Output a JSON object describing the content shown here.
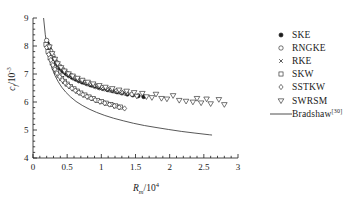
{
  "chart_data": {
    "type": "scatter",
    "title": "",
    "xlabel": "R_m/10^4",
    "ylabel": "c_f/10^-3",
    "xlabel_base": "R",
    "xlabel_sub": "m",
    "xlabel_div": "/10",
    "xlabel_exp": "4",
    "ylabel_base": "c",
    "ylabel_sub": "f",
    "ylabel_div": "/10",
    "ylabel_exp": "-3",
    "xlim": [
      0,
      3
    ],
    "ylim": [
      4,
      9
    ],
    "xticks": [
      0,
      0.5,
      1,
      1.5,
      2,
      2.5,
      3
    ],
    "xticklabels": [
      "0",
      "0.5",
      "1",
      "1.5",
      "2",
      "2.5",
      "3"
    ],
    "yticks": [
      4,
      5,
      6,
      7,
      8,
      9
    ],
    "yticklabels": [
      "4",
      "5",
      "6",
      "7",
      "8",
      "9"
    ],
    "x_minor_per_major": 5,
    "y_minor_per_major": 5,
    "grid": false,
    "legend_position": "upper-right-outside",
    "series": [
      {
        "name": "SKE",
        "marker": "filled-circle",
        "color": "#1a1a1a",
        "points": [
          [
            0.21,
            8.1
          ],
          [
            0.24,
            7.92
          ],
          [
            0.27,
            7.74
          ],
          [
            0.3,
            7.58
          ],
          [
            0.33,
            7.44
          ],
          [
            0.36,
            7.32
          ],
          [
            0.4,
            7.2
          ],
          [
            0.44,
            7.1
          ],
          [
            0.48,
            7.02
          ],
          [
            0.52,
            6.95
          ],
          [
            0.57,
            6.88
          ],
          [
            0.62,
            6.82
          ],
          [
            0.67,
            6.76
          ],
          [
            0.72,
            6.71
          ],
          [
            0.78,
            6.66
          ],
          [
            0.84,
            6.61
          ],
          [
            0.9,
            6.56
          ],
          [
            0.96,
            6.52
          ],
          [
            1.02,
            6.48
          ],
          [
            1.09,
            6.44
          ],
          [
            1.16,
            6.4
          ],
          [
            1.23,
            6.36
          ],
          [
            1.3,
            6.32
          ],
          [
            1.38,
            6.28
          ],
          [
            1.46,
            6.25
          ],
          [
            1.54,
            6.22
          ],
          [
            1.62,
            6.19
          ]
        ]
      },
      {
        "name": "RNGKE",
        "marker": "open-circle",
        "color": "#1a1a1a",
        "points": [
          [
            0.2,
            8.2
          ],
          [
            0.23,
            8.0
          ],
          [
            0.26,
            7.82
          ],
          [
            0.29,
            7.66
          ],
          [
            0.32,
            7.52
          ],
          [
            0.35,
            7.4
          ],
          [
            0.39,
            7.28
          ],
          [
            0.43,
            7.18
          ],
          [
            0.47,
            7.09
          ],
          [
            0.51,
            7.01
          ],
          [
            0.56,
            6.94
          ],
          [
            0.61,
            6.87
          ],
          [
            0.66,
            6.81
          ],
          [
            0.71,
            6.76
          ],
          [
            0.77,
            6.7
          ],
          [
            0.83,
            6.65
          ],
          [
            0.89,
            6.6
          ],
          [
            0.95,
            6.56
          ],
          [
            1.01,
            6.51
          ],
          [
            1.08,
            6.47
          ],
          [
            1.15,
            6.43
          ],
          [
            1.22,
            6.39
          ],
          [
            1.29,
            6.35
          ],
          [
            1.37,
            6.32
          ],
          [
            1.45,
            6.28
          ]
        ]
      },
      {
        "name": "RKE",
        "marker": "cross-dot",
        "color": "#1a1a1a",
        "points": [
          [
            0.22,
            7.88
          ],
          [
            0.25,
            7.72
          ],
          [
            0.28,
            7.58
          ],
          [
            0.31,
            7.46
          ],
          [
            0.34,
            7.35
          ],
          [
            0.38,
            7.24
          ],
          [
            0.42,
            7.14
          ],
          [
            0.46,
            7.06
          ],
          [
            0.5,
            6.98
          ],
          [
            0.55,
            6.91
          ],
          [
            0.6,
            6.84
          ],
          [
            0.65,
            6.78
          ],
          [
            0.7,
            6.73
          ],
          [
            0.76,
            6.67
          ],
          [
            0.82,
            6.62
          ],
          [
            0.88,
            6.57
          ],
          [
            0.94,
            6.53
          ],
          [
            1.0,
            6.48
          ],
          [
            1.07,
            6.44
          ],
          [
            1.14,
            6.4
          ],
          [
            1.21,
            6.36
          ],
          [
            1.28,
            6.33
          ],
          [
            1.36,
            6.29
          ]
        ]
      },
      {
        "name": "SKW",
        "marker": "open-square",
        "color": "#1a1a1a",
        "points": [
          [
            0.19,
            8.06
          ],
          [
            0.22,
            7.8
          ],
          [
            0.25,
            7.58
          ],
          [
            0.28,
            7.4
          ],
          [
            0.31,
            7.24
          ],
          [
            0.34,
            7.1
          ],
          [
            0.38,
            6.96
          ],
          [
            0.42,
            6.84
          ],
          [
            0.46,
            6.74
          ],
          [
            0.5,
            6.64
          ],
          [
            0.55,
            6.55
          ],
          [
            0.6,
            6.47
          ],
          [
            0.65,
            6.39
          ],
          [
            0.7,
            6.32
          ],
          [
            0.76,
            6.25
          ],
          [
            0.82,
            6.18
          ],
          [
            0.88,
            6.12
          ],
          [
            0.94,
            6.06
          ],
          [
            1.0,
            6.01
          ],
          [
            1.07,
            5.96
          ],
          [
            1.14,
            5.91
          ],
          [
            1.21,
            5.86
          ],
          [
            1.28,
            5.82
          ]
        ]
      },
      {
        "name": "SSTKW",
        "marker": "open-diamond",
        "color": "#1a1a1a",
        "points": [
          [
            0.2,
            7.95
          ],
          [
            0.23,
            7.7
          ],
          [
            0.26,
            7.5
          ],
          [
            0.29,
            7.32
          ],
          [
            0.32,
            7.17
          ],
          [
            0.35,
            7.03
          ],
          [
            0.39,
            6.9
          ],
          [
            0.43,
            6.78
          ],
          [
            0.47,
            6.68
          ],
          [
            0.52,
            6.58
          ],
          [
            0.57,
            6.49
          ],
          [
            0.62,
            6.41
          ],
          [
            0.67,
            6.34
          ],
          [
            0.73,
            6.26
          ],
          [
            0.79,
            6.19
          ],
          [
            0.85,
            6.13
          ],
          [
            0.91,
            6.07
          ],
          [
            0.98,
            6.01
          ],
          [
            1.05,
            5.96
          ],
          [
            1.12,
            5.91
          ],
          [
            1.19,
            5.86
          ],
          [
            1.26,
            5.81
          ],
          [
            1.34,
            5.77
          ]
        ]
      },
      {
        "name": "SWRSM",
        "marker": "open-down-triangle",
        "color": "#1a1a1a",
        "points": [
          [
            0.24,
            7.96
          ],
          [
            0.28,
            7.72
          ],
          [
            0.32,
            7.52
          ],
          [
            0.36,
            7.36
          ],
          [
            0.41,
            7.22
          ],
          [
            0.46,
            7.1
          ],
          [
            0.52,
            7.0
          ],
          [
            0.58,
            6.92
          ],
          [
            0.65,
            6.84
          ],
          [
            0.72,
            6.77
          ],
          [
            0.8,
            6.7
          ],
          [
            0.88,
            6.64
          ],
          [
            0.97,
            6.58
          ],
          [
            1.06,
            6.52
          ],
          [
            1.16,
            6.47
          ],
          [
            1.26,
            6.42
          ],
          [
            1.37,
            6.38
          ],
          [
            1.48,
            6.33
          ],
          [
            1.52,
            6.2
          ],
          [
            1.6,
            6.3
          ],
          [
            1.66,
            6.18
          ],
          [
            1.74,
            6.15
          ],
          [
            1.8,
            6.27
          ],
          [
            1.88,
            6.12
          ],
          [
            1.96,
            6.1
          ],
          [
            2.05,
            6.22
          ],
          [
            2.14,
            6.05
          ],
          [
            2.24,
            6.02
          ],
          [
            2.34,
            5.99
          ],
          [
            2.4,
            6.12
          ],
          [
            2.46,
            5.96
          ],
          [
            2.54,
            6.1
          ],
          [
            2.6,
            5.93
          ],
          [
            2.72,
            6.08
          ],
          [
            2.8,
            5.9
          ]
        ]
      }
    ],
    "curves": [
      {
        "name": "Bradshaw",
        "label": "Bradshaw",
        "ref": "[30]",
        "style": "solid",
        "color": "#3a3a3a",
        "points": [
          [
            0.155,
            9.0
          ],
          [
            0.18,
            8.4
          ],
          [
            0.21,
            7.9
          ],
          [
            0.24,
            7.52
          ],
          [
            0.28,
            7.2
          ],
          [
            0.32,
            6.95
          ],
          [
            0.37,
            6.72
          ],
          [
            0.42,
            6.53
          ],
          [
            0.48,
            6.35
          ],
          [
            0.55,
            6.18
          ],
          [
            0.63,
            6.02
          ],
          [
            0.72,
            5.88
          ],
          [
            0.82,
            5.75
          ],
          [
            0.93,
            5.63
          ],
          [
            1.05,
            5.52
          ],
          [
            1.18,
            5.42
          ],
          [
            1.32,
            5.33
          ],
          [
            1.47,
            5.24
          ],
          [
            1.63,
            5.16
          ],
          [
            1.8,
            5.09
          ],
          [
            1.98,
            5.02
          ],
          [
            2.17,
            4.95
          ],
          [
            2.37,
            4.89
          ],
          [
            2.58,
            4.83
          ],
          [
            2.62,
            4.82
          ]
        ]
      }
    ]
  },
  "legend": {
    "entries": [
      {
        "label": "SKE",
        "marker": "filled-circle"
      },
      {
        "label": "RNGKE",
        "marker": "open-circle"
      },
      {
        "label": "RKE",
        "marker": "cross-dot"
      },
      {
        "label": "SKW",
        "marker": "open-square"
      },
      {
        "label": "SSTKW",
        "marker": "open-diamond"
      },
      {
        "label": "SWRSM",
        "marker": "open-down-triangle"
      },
      {
        "label": "Bradshaw",
        "marker": "line",
        "ref": "[30]"
      }
    ]
  },
  "colors": {
    "axis": "#1a1a1a",
    "marker": "#1a1a1a",
    "curve": "#3a3a3a",
    "background": "#ffffff"
  }
}
